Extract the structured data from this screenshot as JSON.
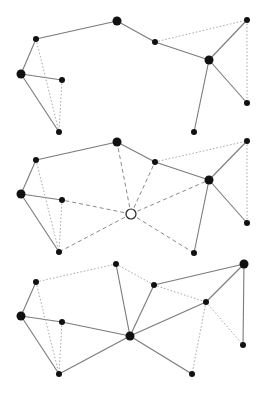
{
  "diagram": {
    "panels": [
      {
        "id": "panel-1",
        "nodes": [
          {
            "id": "a",
            "x": 36,
            "y": 39,
            "r": 3
          },
          {
            "id": "b",
            "x": 21,
            "y": 74,
            "r": 4.5
          },
          {
            "id": "c",
            "x": 62,
            "y": 80,
            "r": 3
          },
          {
            "id": "d",
            "x": 59,
            "y": 132,
            "r": 3
          },
          {
            "id": "e",
            "x": 117,
            "y": 21,
            "r": 4.5
          },
          {
            "id": "f",
            "x": 155,
            "y": 42,
            "r": 3
          },
          {
            "id": "g",
            "x": 209,
            "y": 60,
            "r": 4.5
          },
          {
            "id": "h",
            "x": 247,
            "y": 20,
            "r": 3
          },
          {
            "id": "i",
            "x": 247,
            "y": 103,
            "r": 3
          },
          {
            "id": "j",
            "x": 194,
            "y": 132,
            "r": 3
          }
        ],
        "edges": [
          {
            "from": "a",
            "to": "b",
            "style": "solid"
          },
          {
            "from": "a",
            "to": "e",
            "style": "solid"
          },
          {
            "from": "b",
            "to": "c",
            "style": "solid"
          },
          {
            "from": "b",
            "to": "d",
            "style": "solid"
          },
          {
            "from": "e",
            "to": "f",
            "style": "solid"
          },
          {
            "from": "f",
            "to": "g",
            "style": "solid"
          },
          {
            "from": "g",
            "to": "h",
            "style": "solid"
          },
          {
            "from": "g",
            "to": "i",
            "style": "solid"
          },
          {
            "from": "g",
            "to": "j",
            "style": "solid"
          },
          {
            "from": "a",
            "to": "d",
            "style": "dotted"
          },
          {
            "from": "c",
            "to": "d",
            "style": "dotted"
          },
          {
            "from": "f",
            "to": "h",
            "style": "dotted"
          },
          {
            "from": "h",
            "to": "i",
            "style": "dotted"
          }
        ]
      },
      {
        "id": "panel-2",
        "nodes": [
          {
            "id": "a",
            "x": 36,
            "y": 160,
            "r": 3
          },
          {
            "id": "b",
            "x": 21,
            "y": 194,
            "r": 4.5
          },
          {
            "id": "c",
            "x": 62,
            "y": 200,
            "r": 3
          },
          {
            "id": "d",
            "x": 59,
            "y": 252,
            "r": 3
          },
          {
            "id": "e",
            "x": 117,
            "y": 142,
            "r": 4.5
          },
          {
            "id": "f",
            "x": 155,
            "y": 162,
            "r": 3
          },
          {
            "id": "g",
            "x": 209,
            "y": 180,
            "r": 4.5
          },
          {
            "id": "h",
            "x": 247,
            "y": 141,
            "r": 3
          },
          {
            "id": "i",
            "x": 247,
            "y": 223,
            "r": 3
          },
          {
            "id": "j",
            "x": 194,
            "y": 253,
            "r": 3
          },
          {
            "id": "hub",
            "x": 131,
            "y": 214,
            "r": 5,
            "hollow": true
          }
        ],
        "edges": [
          {
            "from": "a",
            "to": "b",
            "style": "solid"
          },
          {
            "from": "a",
            "to": "e",
            "style": "solid"
          },
          {
            "from": "b",
            "to": "c",
            "style": "solid"
          },
          {
            "from": "b",
            "to": "d",
            "style": "solid"
          },
          {
            "from": "e",
            "to": "f",
            "style": "solid"
          },
          {
            "from": "f",
            "to": "g",
            "style": "solid"
          },
          {
            "from": "g",
            "to": "h",
            "style": "solid"
          },
          {
            "from": "g",
            "to": "i",
            "style": "solid"
          },
          {
            "from": "g",
            "to": "j",
            "style": "solid"
          },
          {
            "from": "a",
            "to": "d",
            "style": "dotted"
          },
          {
            "from": "c",
            "to": "d",
            "style": "dotted"
          },
          {
            "from": "f",
            "to": "h",
            "style": "dotted"
          },
          {
            "from": "h",
            "to": "i",
            "style": "dotted"
          },
          {
            "from": "hub",
            "to": "e",
            "style": "dashed"
          },
          {
            "from": "hub",
            "to": "f",
            "style": "dashed"
          },
          {
            "from": "hub",
            "to": "g",
            "style": "dashed"
          },
          {
            "from": "hub",
            "to": "j",
            "style": "dashed"
          },
          {
            "from": "hub",
            "to": "d",
            "style": "dashed"
          },
          {
            "from": "hub",
            "to": "c",
            "style": "dashed"
          }
        ]
      },
      {
        "id": "panel-3",
        "nodes": [
          {
            "id": "a",
            "x": 36,
            "y": 282,
            "r": 3
          },
          {
            "id": "b",
            "x": 21,
            "y": 316,
            "r": 4.5
          },
          {
            "id": "c",
            "x": 62,
            "y": 322,
            "r": 3
          },
          {
            "id": "d",
            "x": 59,
            "y": 374,
            "r": 3
          },
          {
            "id": "e",
            "x": 116,
            "y": 264,
            "r": 3
          },
          {
            "id": "hub",
            "x": 130,
            "y": 336,
            "r": 4.5
          },
          {
            "id": "f",
            "x": 154,
            "y": 285,
            "r": 3
          },
          {
            "id": "g",
            "x": 206,
            "y": 302,
            "r": 3
          },
          {
            "id": "h",
            "x": 244,
            "y": 264,
            "r": 4.5
          },
          {
            "id": "i",
            "x": 243,
            "y": 345,
            "r": 3
          },
          {
            "id": "j",
            "x": 192,
            "y": 374,
            "r": 3
          }
        ],
        "edges": [
          {
            "from": "a",
            "to": "b",
            "style": "solid"
          },
          {
            "from": "b",
            "to": "c",
            "style": "solid"
          },
          {
            "from": "b",
            "to": "d",
            "style": "solid"
          },
          {
            "from": "c",
            "to": "hub",
            "style": "solid"
          },
          {
            "from": "d",
            "to": "hub",
            "style": "solid"
          },
          {
            "from": "e",
            "to": "hub",
            "style": "solid"
          },
          {
            "from": "hub",
            "to": "f",
            "style": "solid"
          },
          {
            "from": "hub",
            "to": "g",
            "style": "solid"
          },
          {
            "from": "hub",
            "to": "j",
            "style": "solid"
          },
          {
            "from": "f",
            "to": "h",
            "style": "solid"
          },
          {
            "from": "g",
            "to": "h",
            "style": "solid"
          },
          {
            "from": "h",
            "to": "i",
            "style": "solid"
          },
          {
            "from": "a",
            "to": "e",
            "style": "dotted"
          },
          {
            "from": "a",
            "to": "d",
            "style": "dotted"
          },
          {
            "from": "c",
            "to": "d",
            "style": "dotted"
          },
          {
            "from": "e",
            "to": "f",
            "style": "dotted"
          },
          {
            "from": "f",
            "to": "g",
            "style": "dotted"
          },
          {
            "from": "g",
            "to": "j",
            "style": "dotted"
          },
          {
            "from": "g",
            "to": "i",
            "style": "dotted"
          }
        ]
      }
    ]
  }
}
